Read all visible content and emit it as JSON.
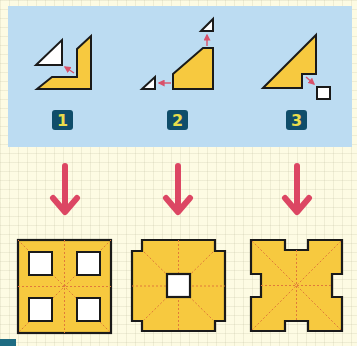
{
  "colors": {
    "panel": "#bcdcf2",
    "background": "#fdfbe3",
    "shape_fill": "#f7c93f",
    "outline": "#1a1a1a",
    "cutout": "#ffffff",
    "arrow_small": "#d9516a",
    "arrow_big": "#dc4663",
    "badge_bg": "#0f4d6a",
    "badge_text": "#e9dc4c",
    "fold_line": "#e07a3a"
  },
  "steps": [
    {
      "badge": "1",
      "description": "Folded piece with triangular corner cut out"
    },
    {
      "badge": "2",
      "description": "Folded piece with two small triangles cut from corners"
    },
    {
      "badge": "3",
      "description": "Folded piece with small square notch cut out"
    }
  ],
  "results": [
    {
      "name": "result-four-square-holes",
      "description": "Square with four square holes"
    },
    {
      "name": "result-center-hole-notched-corners",
      "description": "Octagon-like square with notched corners and one center hole"
    },
    {
      "name": "result-edge-notches",
      "description": "Square with notches cut in the middle of each edge"
    }
  ]
}
